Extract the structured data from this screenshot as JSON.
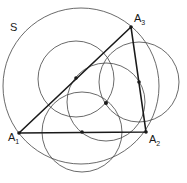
{
  "diagram": {
    "colors": {
      "stroke": "#333333",
      "triangle": "#1a1a1a",
      "background": "#ffffff"
    },
    "labels": {
      "circle_S": "S",
      "A1": {
        "base": "A",
        "sub": "1"
      },
      "A2": {
        "base": "A",
        "sub": "2"
      },
      "A3": {
        "base": "A",
        "sub": "3"
      }
    },
    "vertices": {
      "A1": [
        19,
        133
      ],
      "A2": [
        146,
        132
      ],
      "A3": [
        131,
        27
      ]
    },
    "points": [
      {
        "name": "midpoint-A1A3",
        "xy": [
          76,
          78
        ]
      },
      {
        "name": "midpoint-A2A3",
        "xy": [
          139,
          82
        ]
      },
      {
        "name": "midpoint-A1A2",
        "xy": [
          82,
          132
        ]
      },
      {
        "name": "center-point",
        "xy": [
          106,
          103
        ]
      }
    ],
    "circles": [
      {
        "name": "circle-S",
        "cx": 81,
        "cy": 86,
        "r": 78
      },
      {
        "name": "circle-mid-A1A3",
        "cx": 76,
        "cy": 79,
        "r": 38
      },
      {
        "name": "circle-mid-A2A3",
        "cx": 139,
        "cy": 82,
        "r": 40
      },
      {
        "name": "circle-mid-A1A2",
        "cx": 82,
        "cy": 132,
        "r": 40
      },
      {
        "name": "circle-center",
        "cx": 106,
        "cy": 102,
        "r": 39
      }
    ]
  }
}
